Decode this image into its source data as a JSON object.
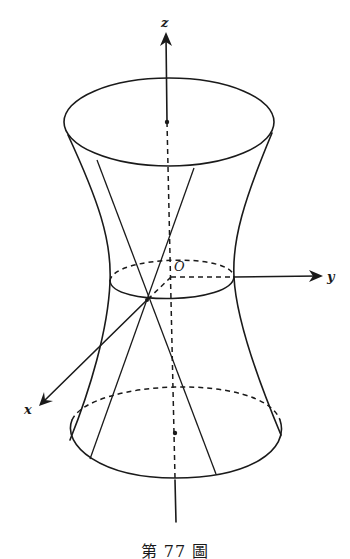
{
  "figure": {
    "caption": "第 77 圖",
    "axes": {
      "x_label": "x",
      "y_label": "y",
      "z_label": "z",
      "origin_label": "O"
    },
    "colors": {
      "ink": "#1a1a1a",
      "background": "#ffffff"
    }
  }
}
